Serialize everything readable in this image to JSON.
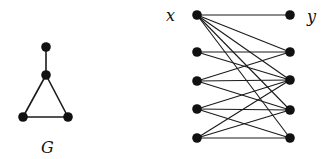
{
  "graph_g": {
    "label": "G",
    "nodes": [
      {
        "id": "a",
        "x": 46,
        "y": 47
      },
      {
        "id": "b",
        "x": 46,
        "y": 75
      },
      {
        "id": "c",
        "x": 23,
        "y": 117
      },
      {
        "id": "d",
        "x": 68,
        "y": 117
      }
    ],
    "edges": [
      [
        "a",
        "b"
      ],
      [
        "b",
        "c"
      ],
      [
        "b",
        "d"
      ],
      [
        "c",
        "d"
      ]
    ]
  },
  "bipartite": {
    "left_label": "x",
    "right_label": "y",
    "left_nodes": [
      {
        "id": "L1",
        "x": 197,
        "y": 15
      },
      {
        "id": "L2",
        "x": 197,
        "y": 52
      },
      {
        "id": "L3",
        "x": 197,
        "y": 81
      },
      {
        "id": "L4",
        "x": 197,
        "y": 109
      },
      {
        "id": "L5",
        "x": 197,
        "y": 138
      }
    ],
    "right_nodes": [
      {
        "id": "R1",
        "x": 290,
        "y": 15
      },
      {
        "id": "R2",
        "x": 290,
        "y": 52
      },
      {
        "id": "R3",
        "x": 290,
        "y": 80
      },
      {
        "id": "R4",
        "x": 290,
        "y": 110
      },
      {
        "id": "R5",
        "x": 290,
        "y": 138
      }
    ],
    "edges": [
      [
        "L1",
        "R1"
      ],
      [
        "L1",
        "R2"
      ],
      [
        "L1",
        "R3"
      ],
      [
        "L1",
        "R4"
      ],
      [
        "L1",
        "R5"
      ],
      [
        "L2",
        "R2"
      ],
      [
        "L2",
        "R3"
      ],
      [
        "L3",
        "R2"
      ],
      [
        "L3",
        "R3"
      ],
      [
        "L3",
        "R4"
      ],
      [
        "L4",
        "R3"
      ],
      [
        "L4",
        "R4"
      ],
      [
        "L4",
        "R5"
      ],
      [
        "L5",
        "R3"
      ],
      [
        "L5",
        "R4"
      ],
      [
        "L5",
        "R5"
      ]
    ]
  }
}
